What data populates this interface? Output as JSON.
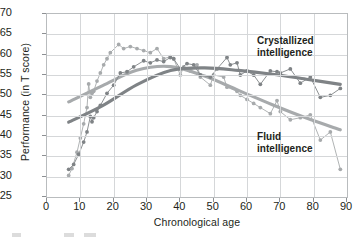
{
  "chart_data": {
    "type": "line",
    "title": "",
    "xlabel": "Chronological age",
    "ylabel": "Performance (in T score)",
    "xlim": [
      0,
      90
    ],
    "ylim": [
      25,
      70
    ],
    "xticks": [
      0,
      10,
      20,
      30,
      40,
      50,
      60,
      70,
      80,
      90
    ],
    "yticks": [
      25,
      30,
      35,
      40,
      45,
      50,
      55,
      60,
      65,
      70
    ],
    "grid": true,
    "legend_position": "inline-annotations",
    "annotations": [
      {
        "text": "Crystallized intelligence",
        "series": "Crystallized intelligence",
        "x": 72,
        "y": 64
      },
      {
        "text": "Fluid intelligence",
        "series": "Fluid intelligence",
        "x": 72,
        "y": 43
      }
    ],
    "series": [
      {
        "name": "Fluid intelligence",
        "color": "#a7aaac",
        "marker": "circle",
        "trend": "smoothed curve",
        "peak": {
          "x": 25,
          "y": 63
        },
        "x": [
          6.5,
          7.5,
          9,
          10,
          11,
          12,
          12.5,
          13,
          13.5,
          14,
          15,
          16,
          17,
          18,
          19,
          21.5,
          23,
          25,
          27,
          29,
          31,
          33,
          35,
          37,
          38,
          40,
          41,
          43,
          45,
          46,
          49,
          50,
          53,
          54,
          57,
          58,
          60,
          62,
          64,
          67,
          69,
          70,
          73,
          76,
          79,
          82,
          85,
          88
        ],
        "y": [
          30.3,
          32.0,
          36.0,
          39.5,
          43.0,
          47.0,
          52.8,
          49.5,
          50.5,
          51.0,
          53.5,
          55.5,
          57.5,
          59.0,
          60.5,
          62.5,
          61.5,
          62.0,
          61.5,
          61.0,
          60.5,
          61.5,
          59.0,
          59.5,
          59.0,
          55.0,
          57.0,
          56.0,
          57.5,
          54.5,
          52.5,
          55.0,
          54.5,
          52.0,
          51.0,
          50.0,
          49.0,
          48.0,
          47.0,
          45.5,
          48.7,
          46.0,
          44.0,
          44.5,
          45.2,
          39.0,
          41.0,
          31.8
        ]
      },
      {
        "name": "Crystallized intelligence",
        "color": "#7f8386",
        "marker": "circle",
        "trend": "smoothed curve",
        "peak": {
          "x": 33,
          "y": 59
        },
        "x": [
          6.5,
          8,
          9.5,
          11,
          12,
          13,
          13.5,
          14,
          15,
          16,
          18,
          20,
          22,
          24,
          26,
          29,
          31,
          33,
          35,
          37,
          38,
          40,
          42,
          44,
          46,
          49,
          51,
          54,
          55,
          57,
          58,
          60,
          62,
          64,
          67,
          69,
          70,
          73,
          76,
          79,
          82,
          85,
          88
        ],
        "y": [
          31.8,
          33.0,
          35.5,
          38.5,
          41.0,
          44.8,
          43.5,
          44.5,
          46.0,
          47.5,
          50.5,
          52.5,
          55.5,
          55.8,
          57.0,
          58.5,
          58.0,
          58.7,
          58.3,
          59.3,
          59.0,
          56.5,
          57.8,
          57.5,
          55.0,
          54.5,
          56.5,
          59.3,
          57.5,
          58.0,
          55.0,
          56.0,
          55.0,
          52.7,
          56.0,
          55.8,
          55.5,
          56.5,
          53.0,
          54.5,
          49.5,
          50.0,
          51.7
        ]
      }
    ]
  },
  "axes": {
    "y_title": "Performance (in T score)",
    "x_title": "Chronological age",
    "y_tick_labels": [
      "70",
      "65",
      "60",
      "55",
      "50",
      "45",
      "40",
      "35",
      "30",
      "25"
    ],
    "x_tick_labels": [
      "0",
      "10",
      "20",
      "30",
      "40",
      "50",
      "60",
      "70",
      "80",
      "90"
    ]
  },
  "labels": {
    "crystallized_line1": "Crystallized",
    "crystallized_line2": "intelligence",
    "fluid_line1": "Fluid",
    "fluid_line2": "intelligence"
  },
  "colors": {
    "fluid": "#a7aaac",
    "crystallized": "#7f8386",
    "grid": "#d5d7d9",
    "frame": "#b9bcbe",
    "text": "#231f20"
  }
}
